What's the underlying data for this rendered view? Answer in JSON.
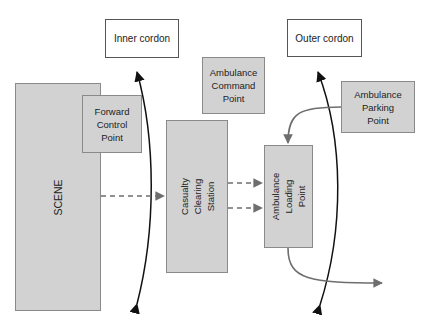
{
  "diagram": {
    "nodes": {
      "inner_cordon": "Inner cordon",
      "outer_cordon": "Outer cordon",
      "scene": "SCENE",
      "forward_control": [
        "Forward",
        "Control",
        "Point"
      ],
      "ambulance_command": [
        "Ambulance",
        "Command",
        "Point"
      ],
      "casualty_clearing": [
        "Casualty",
        "Clearing",
        "Station"
      ],
      "ambulance_loading": [
        "Ambulance",
        "Loading",
        "Point"
      ],
      "ambulance_parking": [
        "Ambulance",
        "Parking",
        "Point"
      ]
    },
    "edges": [
      {
        "from": "SCENE",
        "to": "Casualty Clearing Station",
        "style": "dashed"
      },
      {
        "from": "Casualty Clearing Station",
        "to": "Ambulance Loading Point",
        "style": "dashed",
        "count": 2
      },
      {
        "from": "Ambulance Parking Point",
        "to": "Ambulance Loading Point",
        "style": "solid-curved"
      },
      {
        "from": "Ambulance Loading Point",
        "to": "exit-right",
        "style": "solid-curved"
      }
    ],
    "cordon_lines": [
      "Inner cordon",
      "Outer cordon"
    ],
    "colors": {
      "box_fill": "#d2d2d2",
      "box_border": "#8a8a8a",
      "arrow_grey": "#6e6e6e",
      "cordon_line": "#111111"
    }
  }
}
